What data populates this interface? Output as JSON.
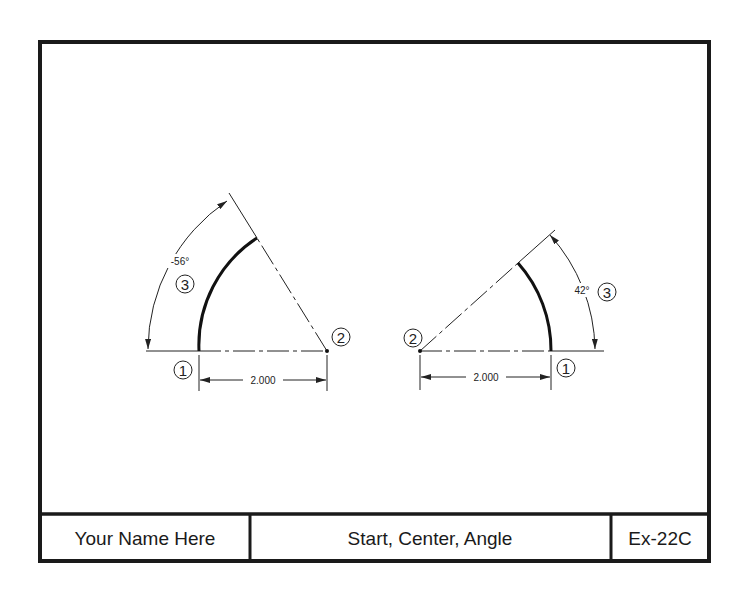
{
  "title_block": {
    "name": "Your Name Here",
    "title": "Start, Center, Angle",
    "exercise": "Ex-22C"
  },
  "figures": [
    {
      "id": "left",
      "method": "Start, Center, Angle",
      "start_label": "1",
      "center_label": "2",
      "angle_label": "3",
      "angle_text": "-56°",
      "angle_deg": -56,
      "radius_text": "2.000"
    },
    {
      "id": "right",
      "method": "Start, Center, Angle",
      "start_label": "1",
      "center_label": "2",
      "angle_label": "3",
      "angle_text": "42°",
      "angle_deg": 42,
      "radius_text": "2.000"
    }
  ],
  "colors": {
    "line": "#111111",
    "border": "#1a1a1a",
    "background": "#ffffff"
  }
}
